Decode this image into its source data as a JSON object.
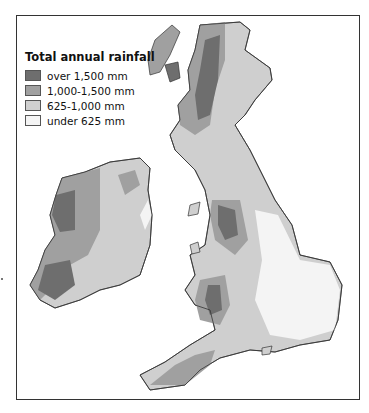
{
  "legend": {
    "title": "Total annual rainfall",
    "items": [
      {
        "label": "over 1,500 mm",
        "color": "#6e6e6e"
      },
      {
        "label": "1,000-1,500 mm",
        "color": "#a0a0a0"
      },
      {
        "label": "625-1,000 mm",
        "color": "#cfcfcf"
      },
      {
        "label": "under 625 mm",
        "color": "#f4f4f4"
      }
    ]
  },
  "colors": {
    "coastline": "#333333",
    "sea": "#ffffff",
    "frame": "#333333"
  }
}
